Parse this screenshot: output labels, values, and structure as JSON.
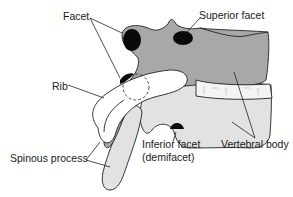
{
  "figure": {
    "colors": {
      "bone_dark": "#a8a8a8",
      "bone_light": "#e2e2e2",
      "facet": "#0a0a0a",
      "disc": "#f4f4f4",
      "line": "#222222",
      "background": "#ffffff"
    },
    "labels": {
      "facet": "Facet",
      "superior_facet": "Superior facet",
      "rib": "Rib",
      "spinous_process": "Spinous process",
      "inferior_facet_line1": "Inferior facet",
      "inferior_facet_line2": "(demifacet)",
      "vertebral_body": "Vertebral body"
    }
  }
}
